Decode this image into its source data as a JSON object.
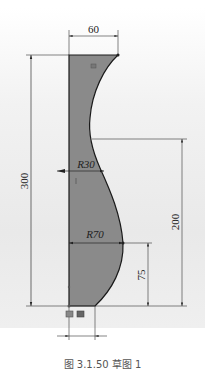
{
  "figure": {
    "caption": "图 3.1.50  草图 1",
    "colors": {
      "profile_fill": "#8a8a8a",
      "profile_stroke": "#1a1a1a",
      "dimension_line": "#333333",
      "background": "#ececec"
    }
  },
  "dimensions": {
    "width_top": "60",
    "height_total": "300",
    "height_200": "200",
    "height_75": "75",
    "radius_small": "R30",
    "radius_large": "R70"
  }
}
